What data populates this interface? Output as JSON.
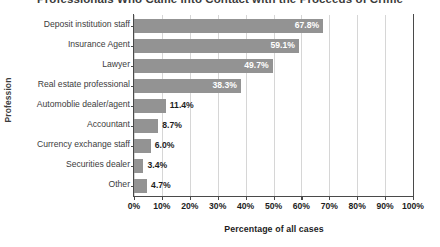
{
  "chart_data": {
    "type": "bar",
    "orientation": "horizontal",
    "title": "Professionals Who Came into Contact with the Proceeds of Crime",
    "xlabel": "Percentage of all cases",
    "ylabel": "Profession",
    "categories": [
      "Deposit institution staff",
      "Insurance Agent",
      "Lawyer",
      "Real estate professional",
      "Automoblie dealer/agent",
      "Accountant",
      "Currency exchange staff",
      "Securities dealer",
      "Other"
    ],
    "values": [
      67.8,
      59.1,
      49.7,
      38.3,
      11.4,
      8.7,
      6.0,
      3.4,
      4.7
    ],
    "value_labels": [
      "67.8%",
      "59.1%",
      "49.7%",
      "38.3%",
      "11.4%",
      "8.7%",
      "6.0%",
      "3.4%",
      "4.7%"
    ],
    "label_placement": [
      "inside",
      "inside",
      "inside",
      "inside",
      "outside",
      "outside",
      "outside",
      "outside",
      "outside"
    ],
    "xlim": [
      0,
      100
    ],
    "xticks": [
      0,
      10,
      20,
      30,
      40,
      50,
      60,
      70,
      80,
      90,
      100
    ],
    "xtick_labels": [
      "0%",
      "10%",
      "20%",
      "30%",
      "40%",
      "50%",
      "60%",
      "70%",
      "80%",
      "90%",
      "100%"
    ],
    "grid": "vertical",
    "legend": "none",
    "bar_color": "#939393",
    "gridline_color": "#d6d6d6",
    "axis_color": "#4a4a4a",
    "inside_label_color": "#ffffff",
    "outside_label_color": "#1d1d1d"
  }
}
